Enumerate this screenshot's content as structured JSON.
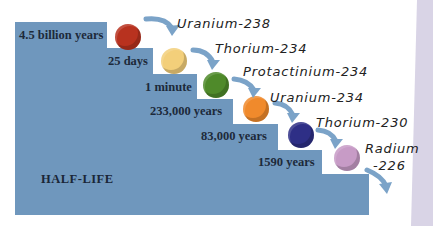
{
  "diagram": {
    "title": "HALF-LIFE",
    "colors": {
      "stairs": "#6f97bd",
      "arrow": "#7ba3c8",
      "side_strip": "#d9d4e6"
    },
    "steps": [
      {
        "half_life": "4.5 billion years",
        "isotope": "Uranium-238",
        "ball_color": "#b8321f"
      },
      {
        "half_life": "25 days",
        "isotope": "Thorium-234",
        "ball_color": "#f3cf7a"
      },
      {
        "half_life": "1 minute",
        "isotope": "Protactinium-234",
        "ball_color": "#4f8a2a"
      },
      {
        "half_life": "233,000 years",
        "isotope": "Uranium-234",
        "ball_color": "#f08a2c"
      },
      {
        "half_life": "83,000 years",
        "isotope": "Thorium-230",
        "ball_color": "#2e2f86"
      },
      {
        "half_life": "1590 years",
        "isotope_line1": "Radium",
        "isotope_line2": "-226",
        "ball_color": "#c79bc6"
      }
    ]
  }
}
